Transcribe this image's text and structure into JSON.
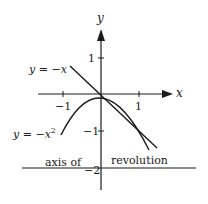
{
  "figure": {
    "axes": {
      "x_label": "x",
      "y_label": "y",
      "x_ticks": [
        {
          "value": -1,
          "label": "−1"
        },
        {
          "value": 1,
          "label": "1"
        }
      ],
      "y_ticks": [
        {
          "value": 1,
          "label": "1"
        },
        {
          "value": -1,
          "label": "−1"
        },
        {
          "value": -2,
          "label": "−2"
        }
      ]
    },
    "curves": [
      {
        "name": "line",
        "label": "y = −x",
        "equation": "y = -x"
      },
      {
        "name": "parabola",
        "label_base": "y = −x",
        "label_exp": "2",
        "equation": "y = -x^2"
      }
    ],
    "axis_of_revolution": {
      "label_left": "axis of",
      "label_right": "revolution",
      "y_value": -2
    },
    "colors": {
      "ink": "#1a1a1a",
      "background": "#ffffff"
    }
  }
}
